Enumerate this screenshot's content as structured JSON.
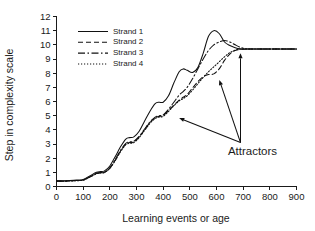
{
  "chart_data": {
    "type": "line",
    "title": "",
    "xlabel": "Learning events or age",
    "ylabel": "Step in complexity scale",
    "xlim": [
      0,
      900
    ],
    "ylim": [
      0,
      12
    ],
    "grid": false,
    "legend_position": "upper-left-inside",
    "x_ticks": [
      0,
      100,
      200,
      300,
      400,
      500,
      600,
      700,
      800,
      900
    ],
    "y_ticks": [
      0,
      1,
      2,
      3,
      4,
      5,
      6,
      7,
      8,
      9,
      10,
      11,
      12
    ],
    "x_tick_labels": [
      "0",
      "100",
      "200",
      "300",
      "400",
      "500",
      "600",
      "700",
      "800",
      "900"
    ],
    "y_tick_labels": [
      "0",
      "1",
      "2",
      "3",
      "4",
      "5",
      "6",
      "7",
      "8",
      "9",
      "10",
      "11",
      "12"
    ],
    "x": [
      0,
      25,
      50,
      75,
      100,
      125,
      150,
      165,
      180,
      200,
      220,
      240,
      260,
      275,
      290,
      310,
      330,
      350,
      370,
      385,
      400,
      420,
      440,
      460,
      475,
      490,
      510,
      530,
      550,
      570,
      590,
      610,
      630,
      650,
      670,
      690,
      710,
      730,
      760,
      800,
      850,
      900
    ],
    "series": [
      {
        "name": "Strand 1",
        "style": "solid",
        "dasharray": "none",
        "values": [
          0.4,
          0.4,
          0.42,
          0.45,
          0.5,
          0.75,
          1.0,
          1.05,
          1.1,
          1.45,
          2.1,
          2.8,
          3.35,
          3.45,
          3.5,
          3.9,
          4.6,
          5.3,
          5.85,
          5.95,
          5.95,
          6.4,
          7.3,
          8.1,
          8.3,
          8.2,
          8.05,
          8.4,
          9.4,
          10.6,
          11.0,
          10.8,
          10.2,
          9.95,
          9.8,
          9.72,
          9.7,
          9.7,
          9.7,
          9.7,
          9.7,
          9.7
        ]
      },
      {
        "name": "Strand 2",
        "style": "dashed",
        "dasharray": "5,3",
        "values": [
          0.38,
          0.38,
          0.4,
          0.42,
          0.46,
          0.68,
          0.92,
          0.97,
          1.0,
          1.3,
          1.85,
          2.5,
          3.0,
          3.1,
          3.15,
          3.5,
          4.0,
          4.5,
          4.85,
          4.95,
          5.0,
          5.35,
          5.75,
          6.1,
          6.3,
          6.5,
          6.95,
          7.4,
          7.75,
          7.9,
          7.95,
          8.3,
          8.9,
          9.35,
          9.6,
          9.68,
          9.7,
          9.7,
          9.7,
          9.7,
          9.7,
          9.7
        ]
      },
      {
        "name": "Strand 3",
        "style": "dash-dot",
        "dasharray": "7,2.5,1.5,2.5",
        "values": [
          0.38,
          0.38,
          0.4,
          0.42,
          0.46,
          0.68,
          0.93,
          0.98,
          1.02,
          1.32,
          1.9,
          2.55,
          3.05,
          3.15,
          3.2,
          3.55,
          4.05,
          4.55,
          4.9,
          5.0,
          5.05,
          5.45,
          5.95,
          6.45,
          6.7,
          7.0,
          7.6,
          8.3,
          9.0,
          9.6,
          10.0,
          10.2,
          10.3,
          10.2,
          10.0,
          9.82,
          9.72,
          9.7,
          9.7,
          9.7,
          9.7,
          9.7
        ]
      },
      {
        "name": "Strand 4",
        "style": "dotted",
        "dasharray": "1.2,1.8",
        "values": [
          0.37,
          0.37,
          0.39,
          0.41,
          0.45,
          0.66,
          0.9,
          0.95,
          0.99,
          1.28,
          1.82,
          2.45,
          2.95,
          3.05,
          3.1,
          3.45,
          3.95,
          4.45,
          4.8,
          4.9,
          4.95,
          5.3,
          5.7,
          6.05,
          6.2,
          6.4,
          6.8,
          7.25,
          7.7,
          8.1,
          8.45,
          8.8,
          9.15,
          9.45,
          9.62,
          9.69,
          9.7,
          9.7,
          9.7,
          9.7,
          9.7,
          9.7
        ]
      }
    ],
    "annotations": [
      {
        "text": "Attractors",
        "anchor_x": 690,
        "anchor_y": 3.1,
        "targets": [
          {
            "x": 690,
            "y": 9.45
          },
          {
            "x": 610,
            "y": 7.55
          },
          {
            "x": 458,
            "y": 4.85
          }
        ]
      }
    ]
  },
  "legend": {
    "entries": [
      {
        "label": "Strand 1"
      },
      {
        "label": "Strand 2"
      },
      {
        "label": "Strand 3"
      },
      {
        "label": "Strand 4"
      }
    ]
  },
  "colors": {
    "ink": "#111111",
    "background": "#ffffff"
  }
}
